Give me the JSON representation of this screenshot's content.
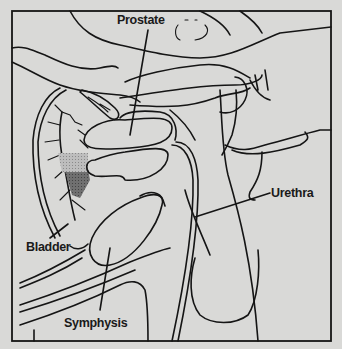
{
  "diagram": {
    "type": "anatomical-sagittal-section",
    "background": "#d9d9d7",
    "ink": "#151515",
    "shade": "#6a6a6a",
    "labels": {
      "prostate": "Prostate",
      "urethra": "Urethra",
      "bladder": "Bladder",
      "symphysis": "Symphysis"
    }
  }
}
